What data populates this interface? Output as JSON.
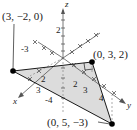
{
  "figure": {
    "type": "3d-coordinate-triangle",
    "axes": {
      "x": {
        "label": "x",
        "ticks": [
          "2",
          "3"
        ],
        "negative_ticks": [
          "-3"
        ]
      },
      "y": {
        "label": "y",
        "ticks": [
          "2",
          "3",
          "4"
        ]
      },
      "z": {
        "label": "z",
        "ticks": [
          "2"
        ],
        "negative_ticks": [
          "-4"
        ]
      }
    },
    "vertices": [
      {
        "label": "(3, −2, 0)",
        "coords": [
          3,
          -2,
          0
        ]
      },
      {
        "label": "(0, 3, 2)",
        "coords": [
          0,
          3,
          2
        ]
      },
      {
        "label": "(0, 5, −3)",
        "coords": [
          0,
          5,
          -3
        ]
      }
    ],
    "right_angle_at": "(0, 3, 2)",
    "colors": {
      "fill": "#dcdcdc",
      "edge": "#1a1a1a",
      "axis": "#555555",
      "dashed": "#888888"
    }
  }
}
